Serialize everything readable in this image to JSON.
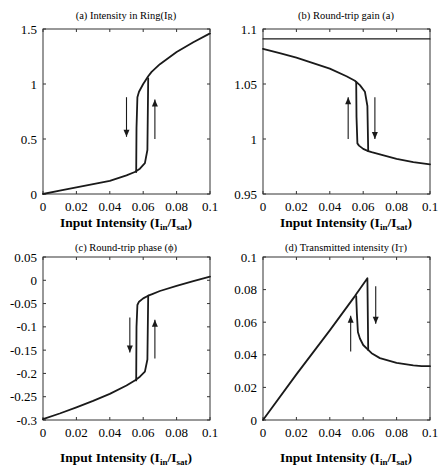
{
  "figure": {
    "xlabel_main": "Input Intensity (I",
    "xlabel_sub1": "in",
    "xlabel_mid": "/I",
    "xlabel_sub2": "sat",
    "xlabel_end": ")",
    "colors": {
      "line": "#1a1a1a",
      "axis": "#333333",
      "background": "#ffffff"
    }
  },
  "chart_data": [
    {
      "id": "a",
      "type": "line",
      "title": "(a) Intensity in Ring(I",
      "title_sub": "R",
      "title_end": ")",
      "xlabel": "Input Intensity (Iin/Isat)",
      "ylabel": "",
      "xlim": [
        0,
        0.1
      ],
      "ylim": [
        0,
        1.5
      ],
      "xticks": [
        0,
        0.02,
        0.04,
        0.06,
        0.08,
        0.1
      ],
      "xtick_labels": [
        "0",
        "0.02",
        "0.04",
        "0.06",
        "0.08",
        "0.1"
      ],
      "yticks": [
        0,
        0.5,
        1,
        1.5
      ],
      "ytick_labels": [
        "0",
        "0.5",
        "1",
        "1.5"
      ],
      "grid": false,
      "series": [
        {
          "name": "lower branch (increasing)",
          "x": [
            0,
            0.01,
            0.02,
            0.03,
            0.04,
            0.05,
            0.055,
            0.058,
            0.061,
            0.0625,
            0.063
          ],
          "y": [
            0,
            0.03,
            0.06,
            0.09,
            0.12,
            0.17,
            0.2,
            0.23,
            0.28,
            0.4,
            1.05
          ]
        },
        {
          "name": "upper branch (decreasing)",
          "x": [
            0.1,
            0.09,
            0.08,
            0.07,
            0.065,
            0.063,
            0.06,
            0.0575,
            0.0565,
            0.056,
            0.0558
          ],
          "y": [
            1.46,
            1.38,
            1.29,
            1.18,
            1.11,
            1.07,
            1.0,
            0.93,
            0.88,
            0.6,
            0.2
          ]
        }
      ],
      "annotations": [
        {
          "type": "arrow",
          "direction": "down",
          "x": 0.05,
          "y_from": 0.88,
          "y_to": 0.52
        },
        {
          "type": "arrow",
          "direction": "up",
          "x": 0.067,
          "y_from": 0.5,
          "y_to": 0.86
        }
      ]
    },
    {
      "id": "b",
      "type": "line",
      "title": "(b) Round-trip gain (a)",
      "xlabel": "Input Intensity (Iin/Isat)",
      "ylabel": "",
      "xlim": [
        0,
        0.1
      ],
      "ylim": [
        0.95,
        1.1
      ],
      "xticks": [
        0,
        0.02,
        0.04,
        0.06,
        0.08,
        0.1
      ],
      "xtick_labels": [
        "0",
        "0.02",
        "0.04",
        "0.06",
        "0.08",
        "0.1"
      ],
      "yticks": [
        0.95,
        1,
        1.05,
        1.1
      ],
      "ytick_labels": [
        "0.95",
        "1",
        "1.05",
        "1.1"
      ],
      "grid": false,
      "series": [
        {
          "name": "threshold",
          "x": [
            0,
            0.1
          ],
          "y": [
            1.091,
            1.091
          ]
        },
        {
          "name": "upper branch (increasing)",
          "x": [
            0,
            0.01,
            0.02,
            0.03,
            0.04,
            0.05,
            0.055,
            0.058,
            0.061,
            0.0625,
            0.063
          ],
          "y": [
            1.082,
            1.078,
            1.074,
            1.069,
            1.064,
            1.057,
            1.053,
            1.049,
            1.043,
            1.03,
            0.989
          ]
        },
        {
          "name": "lower branch (decreasing)",
          "x": [
            0.1,
            0.09,
            0.08,
            0.07,
            0.065,
            0.063,
            0.06,
            0.0575,
            0.0565,
            0.056,
            0.0558
          ],
          "y": [
            0.977,
            0.979,
            0.982,
            0.986,
            0.988,
            0.989,
            0.991,
            0.994,
            0.996,
            1.02,
            1.052
          ]
        }
      ],
      "annotations": [
        {
          "type": "arrow",
          "direction": "up",
          "x": 0.051,
          "y_from": 1.0,
          "y_to": 1.038
        },
        {
          "type": "arrow",
          "direction": "down",
          "x": 0.067,
          "y_from": 1.038,
          "y_to": 1.0
        }
      ]
    },
    {
      "id": "c",
      "type": "line",
      "title": "(c) Round-trip phase (ϕ)",
      "xlabel": "Input Intensity (Iin/Isat)",
      "ylabel": "",
      "xlim": [
        0,
        0.1
      ],
      "ylim": [
        -0.3,
        0.05
      ],
      "xticks": [
        0,
        0.02,
        0.04,
        0.06,
        0.08,
        0.1
      ],
      "xtick_labels": [
        "0",
        "0.02",
        "0.04",
        "0.06",
        "0.08",
        "0.1"
      ],
      "yticks": [
        -0.3,
        -0.25,
        -0.2,
        -0.15,
        -0.1,
        -0.05,
        0,
        0.05
      ],
      "ytick_labels": [
        "-0.3",
        "-0.25",
        "-0.2",
        "-0.15",
        "-0.1",
        "-0.05",
        "0",
        "0.05"
      ],
      "grid": false,
      "series": [
        {
          "name": "lower branch (increasing)",
          "x": [
            0,
            0.01,
            0.02,
            0.03,
            0.04,
            0.05,
            0.055,
            0.058,
            0.061,
            0.0625,
            0.063
          ],
          "y": [
            -0.298,
            -0.286,
            -0.273,
            -0.259,
            -0.244,
            -0.226,
            -0.215,
            -0.207,
            -0.196,
            -0.17,
            -0.033
          ]
        },
        {
          "name": "upper branch (decreasing)",
          "x": [
            0.1,
            0.09,
            0.08,
            0.07,
            0.065,
            0.063,
            0.06,
            0.0575,
            0.0565,
            0.056,
            0.0558
          ],
          "y": [
            0.008,
            -0.002,
            -0.012,
            -0.023,
            -0.03,
            -0.033,
            -0.039,
            -0.046,
            -0.053,
            -0.1,
            -0.215
          ]
        }
      ],
      "annotations": [
        {
          "type": "arrow",
          "direction": "down",
          "x": 0.052,
          "y_from": -0.08,
          "y_to": -0.155
        },
        {
          "type": "arrow",
          "direction": "up",
          "x": 0.067,
          "y_from": -0.168,
          "y_to": -0.085
        }
      ]
    },
    {
      "id": "d",
      "type": "line",
      "title": "(d) Transmitted intensity (I",
      "title_sub": "T",
      "title_end": ")",
      "xlabel": "Input Intensity (Iin/Isat)",
      "ylabel": "",
      "xlim": [
        0,
        0.1
      ],
      "ylim": [
        0,
        0.1
      ],
      "xticks": [
        0,
        0.02,
        0.04,
        0.06,
        0.08,
        0.1
      ],
      "xtick_labels": [
        "0",
        "0.02",
        "0.04",
        "0.06",
        "0.08",
        "0.1"
      ],
      "yticks": [
        0,
        0.02,
        0.04,
        0.06,
        0.08,
        0.1
      ],
      "ytick_labels": [
        "0",
        "0.02",
        "0.04",
        "0.06",
        "0.08",
        "0.1"
      ],
      "grid": false,
      "series": [
        {
          "name": "linear branch (increasing)",
          "x": [
            0,
            0.02,
            0.04,
            0.055,
            0.0625,
            0.063
          ],
          "y": [
            0,
            0.028,
            0.055,
            0.076,
            0.087,
            0.043
          ]
        },
        {
          "name": "upper branch (decreasing)",
          "x": [
            0.1,
            0.095,
            0.09,
            0.08,
            0.07,
            0.065,
            0.063,
            0.06,
            0.058,
            0.0568,
            0.0562,
            0.0558
          ],
          "y": [
            0.033,
            0.033,
            0.0335,
            0.035,
            0.038,
            0.041,
            0.043,
            0.046,
            0.05,
            0.054,
            0.065,
            0.076
          ]
        }
      ],
      "annotations": [
        {
          "type": "arrow",
          "direction": "up",
          "x": 0.0525,
          "y_from": 0.042,
          "y_to": 0.064
        },
        {
          "type": "arrow",
          "direction": "down",
          "x": 0.0675,
          "y_from": 0.082,
          "y_to": 0.059
        }
      ]
    }
  ]
}
